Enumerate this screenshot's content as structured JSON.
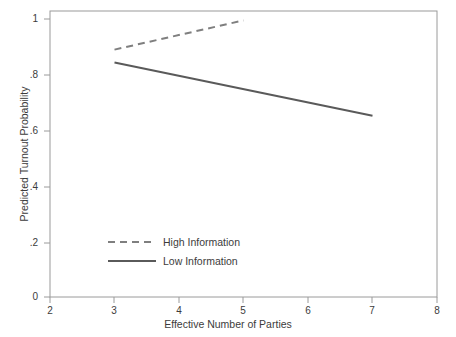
{
  "chart_data": {
    "type": "line",
    "title": "",
    "xlabel": "Effective Number of Parties",
    "ylabel": "Predicted Turnout Probability",
    "xlim": [
      2,
      8
    ],
    "ylim": [
      0,
      1
    ],
    "xticks": [
      "2",
      "3",
      "4",
      "5",
      "6",
      "7",
      "8"
    ],
    "yticks": [
      "0",
      ".2",
      ".4",
      ".6",
      ".8",
      "1"
    ],
    "xtick_values": [
      2,
      3,
      4,
      5,
      6,
      7,
      8
    ],
    "ytick_values": [
      0,
      0.2,
      0.4,
      0.6,
      0.8,
      1
    ],
    "grid": false,
    "legend_position": "lower left inside axes",
    "series": [
      {
        "name": "High Information",
        "style": "dashed",
        "color": "#7f7f7f",
        "x": [
          3,
          5
        ],
        "values": [
          0.865,
          0.967
        ]
      },
      {
        "name": "Low Information",
        "style": "solid",
        "color": "#5a5a5a",
        "x": [
          3,
          7
        ],
        "values": [
          0.82,
          0.634
        ]
      }
    ]
  },
  "legend": {
    "entries": [
      {
        "label": "High Information"
      },
      {
        "label": "Low Information"
      }
    ]
  },
  "colors": {
    "frame": "#9a9a9a",
    "text": "#3c3c3c",
    "high_information": "#7f7f7f",
    "low_information": "#5a5a5a",
    "background": "#ffffff"
  }
}
